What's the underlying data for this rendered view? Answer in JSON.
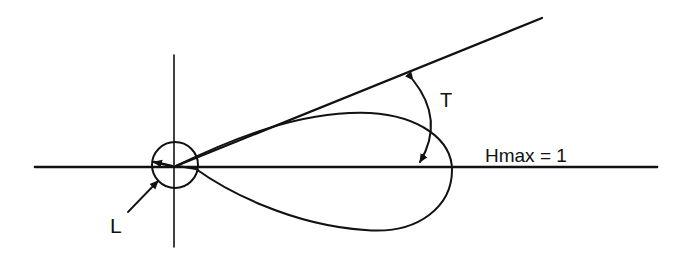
{
  "diagram": {
    "labels": {
      "takeoff_angle": "T",
      "max_gain": "Hmax = 1",
      "loss_circle": "L"
    },
    "colors": {
      "ink": "#111111",
      "background": "#ffffff"
    },
    "elements": [
      "horizontal-axis",
      "vertical-axis",
      "origin-circle",
      "tangent-line",
      "radiation-lobe",
      "angle-arc-T",
      "pointer-arrow-L"
    ]
  }
}
